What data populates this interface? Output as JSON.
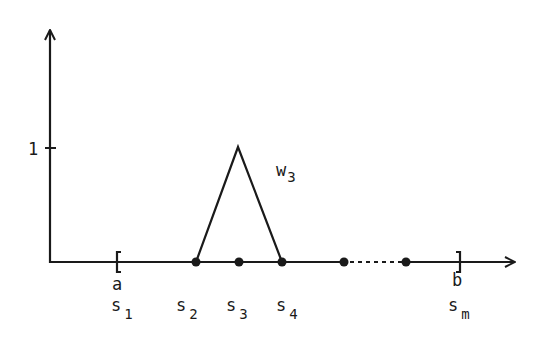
{
  "figure": {
    "y_tick_label": "1",
    "hat_function_label": {
      "base": "w",
      "sub": "3"
    },
    "interval_left_label": "a",
    "interval_right_label": "b",
    "node_labels": [
      {
        "base": "s",
        "sub": "1"
      },
      {
        "base": "s",
        "sub": "2"
      },
      {
        "base": "s",
        "sub": "3"
      },
      {
        "base": "s",
        "sub": "4"
      },
      {
        "base": "s",
        "sub": "m"
      }
    ],
    "colors": {
      "ink": "#1a1a1a",
      "background": "#ffffff"
    }
  }
}
